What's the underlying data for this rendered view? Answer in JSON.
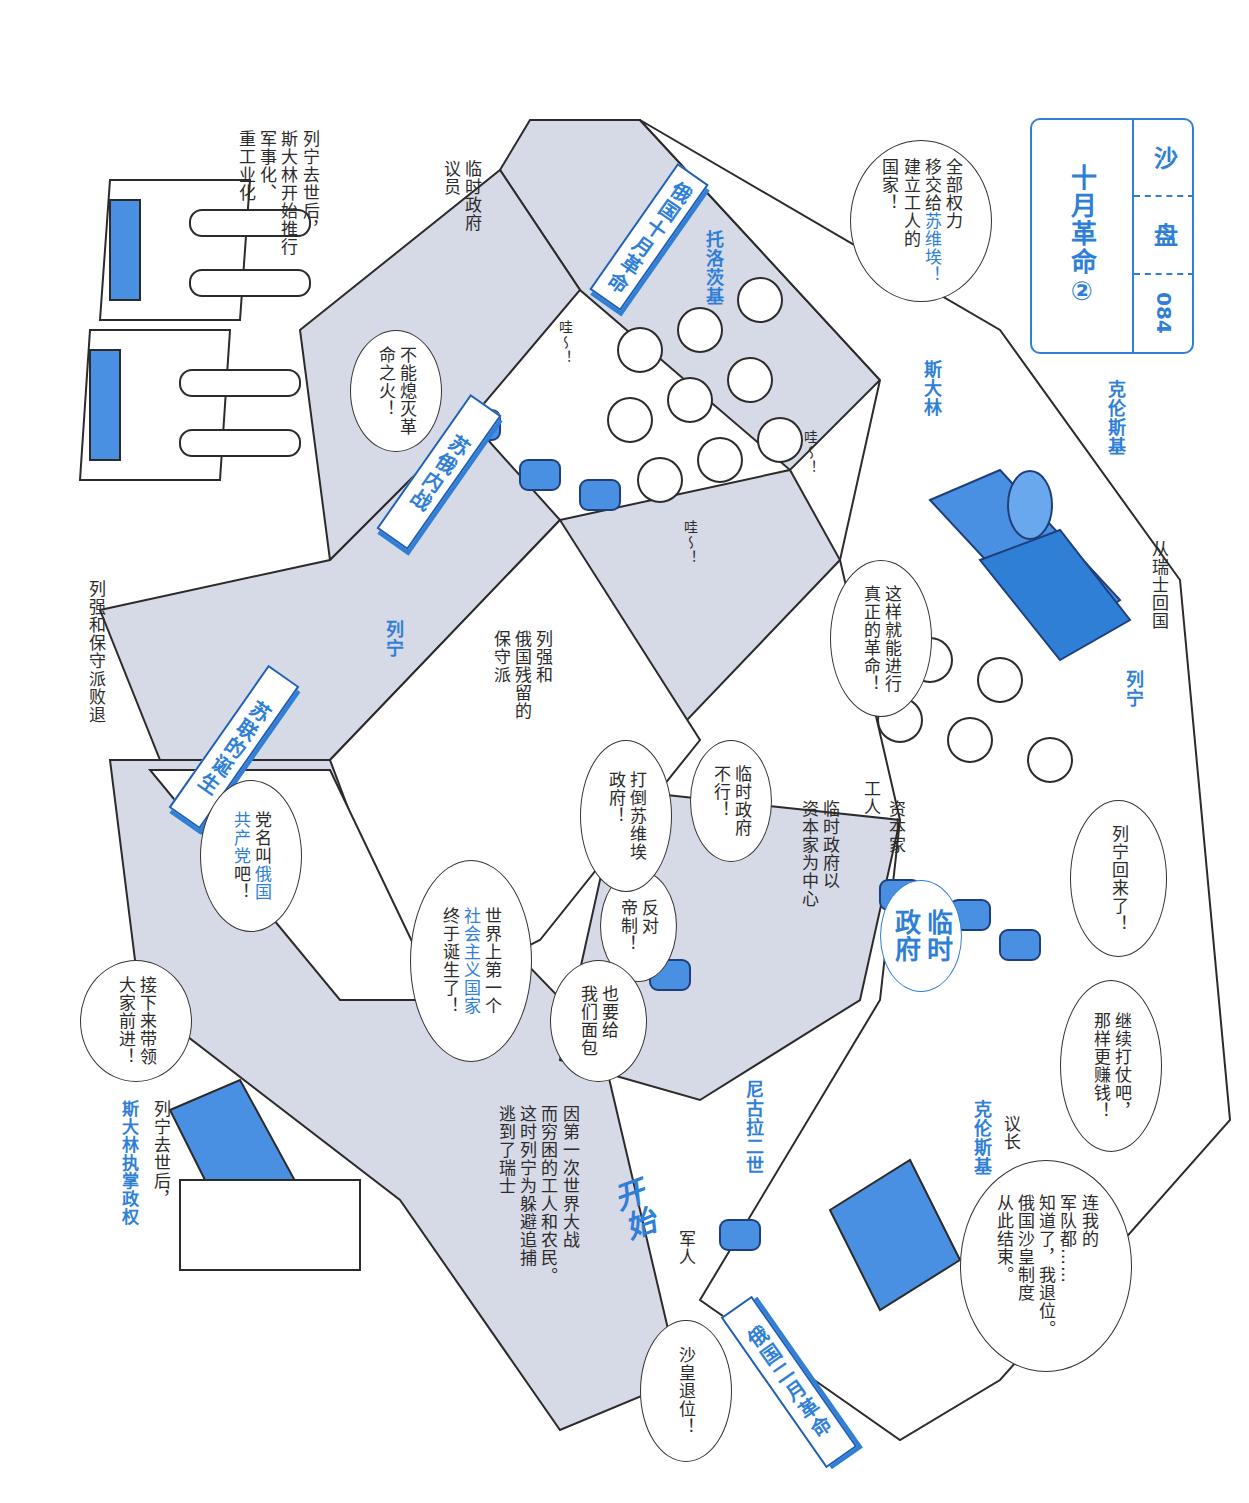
{
  "title_box": {
    "series": "沙",
    "sub": "盘",
    "page_number": "084",
    "title": "十月革命②"
  },
  "banners": {
    "feb_revolution": "俄国二月革命",
    "oct_revolution": "俄国十月革命",
    "civil_war": "苏俄内战",
    "ussr_birth": "苏联的诞生"
  },
  "start_label": "开始",
  "names": {
    "lenin_top": "列宁",
    "lenin_mid": "列宁",
    "stalin_top": "斯大林",
    "trotsky": "托洛茨基",
    "kerensky_top": "克伦斯基",
    "kerensky_chair": "克伦斯基",
    "nicholas": "尼古拉二世"
  },
  "captions": {
    "war_start": "因第一次世界大战\n而穷困的工人和农民。\n这时列宁为躲避追捕\n逃到了瑞士",
    "from_swiss": "从瑞士回国",
    "soldier": "军人",
    "chairman": "议长",
    "worker": "工人",
    "capitalist": "资本家",
    "provisional_center": "临时政府以\n资本家为中心",
    "provisional_member": "临时政府\n议员",
    "powers_conservatives": "列强和\n俄国残留的\n保守派",
    "powers_retreat": "列强和保守派败退",
    "stalin_industry": "列宁去世后，\n斯大林开始推行\n军事化、\n重工业化",
    "stalin_power_1": "列宁去世后，",
    "stalin_power_2": "斯大林执掌政权",
    "provisional_gov_sign": "临时\n政府"
  },
  "speech_bubbles": {
    "tsar_abdicate": "沙皇退位！",
    "tsar_end": "连我的\n军队都……\n知道了，我退位。\n俄国沙皇制度\n从此结束。",
    "keep_fighting": "继续打仗吧，\n那样更赚钱！",
    "lenin_back": "列宁回来了！",
    "anti_tsar": "反对\n帝制！",
    "give_bread": "也要给\n我们面包",
    "gov_no": "临时政府\n不行！",
    "real_revolution": "这样就能进行\n真正的革命！",
    "all_power_1": "全部权力\n移交给",
    "all_power_soviet": "苏维埃！",
    "all_power_2": "建立工人的\n国家！",
    "overthrow": "打倒苏维埃\n政府！",
    "cant_extinguish": "不能熄灭革\n命之火！",
    "first_socialist_1": "世界上第一个",
    "first_socialist_2": "社会主义国家",
    "first_socialist_3": "终于诞生了！",
    "party_name_1": "党名叫",
    "party_name_2": "俄国\n共产党",
    "party_name_3": "吧！",
    "lead_forward": "接下来带领\n大家前进！",
    "wow": "哇～！"
  },
  "colors": {
    "accent_blue": "#2f7fd6",
    "dark_blue": "#1f5fb5",
    "light_blue": "#8bb8ea",
    "path_gray": "#d6d9e6",
    "line": "#2b2b2b"
  }
}
